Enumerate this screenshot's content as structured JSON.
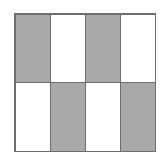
{
  "diagram": {
    "type": "fraction-grid",
    "rows": 2,
    "columns": 4,
    "shaded_color": "#a9a9a9",
    "blank_color": "#ffffff",
    "border_color": "#6e6e6e",
    "cells": [
      {
        "row": 0,
        "col": 0,
        "shaded": true
      },
      {
        "row": 0,
        "col": 1,
        "shaded": false
      },
      {
        "row": 0,
        "col": 2,
        "shaded": true
      },
      {
        "row": 0,
        "col": 3,
        "shaded": false
      },
      {
        "row": 1,
        "col": 0,
        "shaded": false
      },
      {
        "row": 1,
        "col": 1,
        "shaded": true
      },
      {
        "row": 1,
        "col": 2,
        "shaded": false
      },
      {
        "row": 1,
        "col": 3,
        "shaded": true
      }
    ],
    "shaded_count": 4,
    "total_count": 8
  }
}
